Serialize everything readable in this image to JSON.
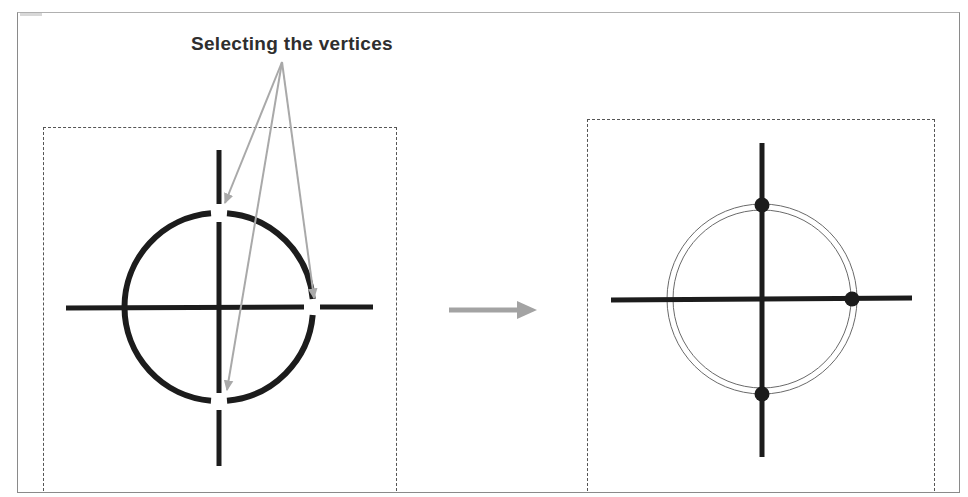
{
  "diagram": {
    "title": "Selecting the vertices",
    "colors": {
      "stroke": "#1c1c1c",
      "annotation_arrow": "#a9a9a9",
      "transition_arrow": "#a3a3a3",
      "frame": "#8a8a8a",
      "dashed_box": "#555555"
    },
    "panels": [
      {
        "id": "before",
        "description": "Circle with crosshair lines; gaps in circle at top, right and bottom intersections indicate vertices being selected",
        "selected_vertices": [
          "top",
          "right",
          "bottom"
        ]
      },
      {
        "id": "after",
        "description": "Circle shown as double outline (selected) with black dots marking the selected vertices",
        "vertex_markers": [
          "top",
          "right",
          "bottom"
        ]
      }
    ],
    "annotation_arrows": 3,
    "transition": "right-arrow"
  }
}
